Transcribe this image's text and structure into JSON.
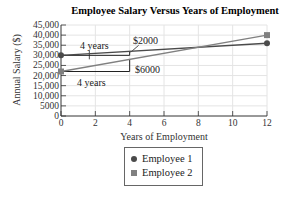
{
  "chart_data": {
    "type": "line",
    "title": "Employee Salary Versus Years of Employment",
    "xlabel": "Years of Employment",
    "ylabel": "Annual Salary ($)",
    "xlim": [
      0,
      12
    ],
    "ylim": [
      0,
      45000
    ],
    "x_ticks": [
      "0",
      "2",
      "4",
      "6",
      "8",
      "10",
      "12"
    ],
    "y_ticks": [
      "0",
      "5000",
      "10,000",
      "15,000",
      "20,000",
      "25,000",
      "30,000",
      "35,000",
      "40,000",
      "45,000"
    ],
    "grid": true,
    "legend_position": "bottom-center",
    "series": [
      {
        "name": "Employee 1",
        "marker": "circle",
        "color": "#4a4a4a",
        "x": [
          0,
          12
        ],
        "y": [
          30000,
          36000
        ]
      },
      {
        "name": "Employee 2",
        "marker": "square",
        "color": "#808080",
        "x": [
          0,
          12
        ],
        "y": [
          22000,
          40000
        ]
      }
    ],
    "annotations": [
      {
        "text": "4 years",
        "series": "Employee 1",
        "x_range": [
          0,
          4
        ]
      },
      {
        "text": "$2000",
        "series": "Employee 1",
        "rise": 2000
      },
      {
        "text": "4 years",
        "series": "Employee 2",
        "x_range": [
          0,
          4
        ]
      },
      {
        "text": "$6000",
        "series": "Employee 2",
        "rise": 6000
      }
    ]
  },
  "legend": {
    "items": [
      {
        "label": "Employee 1"
      },
      {
        "label": "Employee 2"
      }
    ]
  }
}
